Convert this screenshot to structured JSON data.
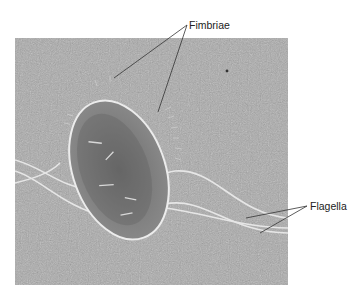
{
  "figure": {
    "labels": [
      {
        "id": "fimbriae",
        "text": "Fimbriae"
      },
      {
        "id": "flagella",
        "text": "Flagella"
      }
    ],
    "colors": {
      "background": "#ffffff",
      "micrograph_base": "#a9a9a9",
      "cell_body": "#7d7d7d",
      "leader_lines": "#333333"
    }
  }
}
